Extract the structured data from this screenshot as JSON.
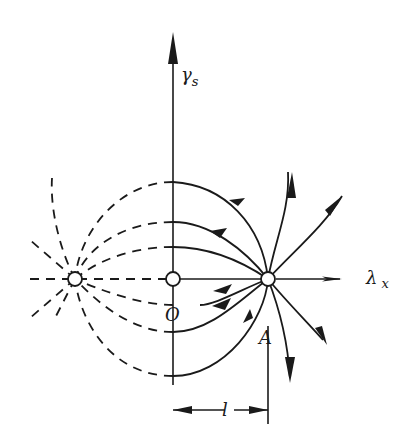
{
  "diagram": {
    "type": "phase-plane field-line diagram",
    "colors": {
      "ink": "#1a1a1a",
      "background": "#ffffff"
    },
    "axes": {
      "vertical": {
        "label": "γ",
        "subscript": "s"
      },
      "horizontal": {
        "label": "λ",
        "subscript": "x"
      }
    },
    "points": {
      "origin": {
        "label": "O"
      },
      "source": {
        "label": "A"
      },
      "image_source": {
        "label": ""
      }
    },
    "dimension": {
      "label": "l"
    },
    "legend": {
      "solid_lines": "field lines with arrows (real region)",
      "dashed_lines": "continuation to image point"
    }
  }
}
